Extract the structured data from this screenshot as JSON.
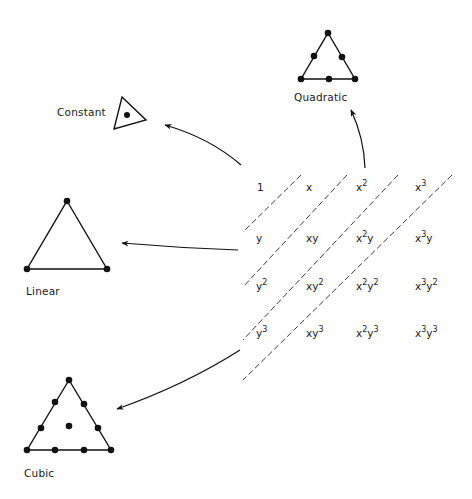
{
  "diagram": {
    "type": "polynomial-terms-to-triangular-elements",
    "elements": [
      {
        "id": "constant",
        "label": "Constant",
        "nodes": 1
      },
      {
        "id": "linear",
        "label": "Linear",
        "nodes": 3
      },
      {
        "id": "quadratic",
        "label": "Quadratic",
        "nodes": 6
      },
      {
        "id": "cubic",
        "label": "Cubic",
        "nodes": 10
      }
    ],
    "terms_grid": {
      "rows": [
        [
          {
            "base": "1",
            "sup": ""
          },
          {
            "base": "x",
            "sup": ""
          },
          {
            "base": "x",
            "sup": "2"
          },
          {
            "base": "x",
            "sup": "3"
          }
        ],
        [
          {
            "base": "y",
            "sup": ""
          },
          {
            "base": "xy",
            "sup": ""
          },
          {
            "base": "x",
            "sup": "2",
            "tail": "y"
          },
          {
            "base": "x",
            "sup": "3",
            "tail": "y"
          }
        ],
        [
          {
            "base": "y",
            "sup": "2"
          },
          {
            "base": "xy",
            "sup": "2"
          },
          {
            "base": "x",
            "sup": "2",
            "tail": "y",
            "tailsup": "2"
          },
          {
            "base": "x",
            "sup": "3",
            "tail": "y",
            "tailsup": "2"
          }
        ],
        [
          {
            "base": "y",
            "sup": "3"
          },
          {
            "base": "xy",
            "sup": "3"
          },
          {
            "base": "x",
            "sup": "2",
            "tail": "y",
            "tailsup": "3"
          },
          {
            "base": "x",
            "sup": "3",
            "tail": "y",
            "tailsup": "3"
          }
        ]
      ]
    },
    "arrows": [
      {
        "from": "term-1",
        "to": "constant"
      },
      {
        "from": "term-y",
        "to": "linear"
      },
      {
        "from": "term-x2",
        "to": "quadratic"
      },
      {
        "from": "term-y3",
        "to": "cubic"
      }
    ]
  },
  "labels": {
    "constant": "Constant",
    "linear": "Linear",
    "quadratic": "Quadratic",
    "cubic": "Cubic"
  },
  "terms": {
    "r0c0": "1",
    "r0c1": "x",
    "r0c2_b": "x",
    "r0c2_s": "2",
    "r0c3_b": "x",
    "r0c3_s": "3",
    "r1c0": "y",
    "r1c1": "xy",
    "r1c2_b": "x",
    "r1c2_s": "2",
    "r1c2_t": "y",
    "r1c3_b": "x",
    "r1c3_s": "3",
    "r1c3_t": "y",
    "r2c0_b": "y",
    "r2c0_s": "2",
    "r2c1_b": "xy",
    "r2c1_s": "2",
    "r2c2_b": "x",
    "r2c2_s": "2",
    "r2c2_t": "y",
    "r2c2_ts": "2",
    "r2c3_b": "x",
    "r2c3_s": "3",
    "r2c3_t": "y",
    "r2c3_ts": "2",
    "r3c0_b": "y",
    "r3c0_s": "3",
    "r3c1_b": "xy",
    "r3c1_s": "3",
    "r3c2_b": "x",
    "r3c2_s": "2",
    "r3c2_t": "y",
    "r3c2_ts": "3",
    "r3c3_b": "x",
    "r3c3_s": "3",
    "r3c3_t": "y",
    "r3c3_ts": "3"
  },
  "colors": {
    "ink": "#111111",
    "background": "#ffffff"
  }
}
